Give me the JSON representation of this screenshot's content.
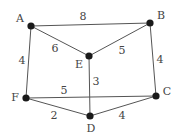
{
  "diagram": {
    "type": "weighted-undirected-graph",
    "nodes": [
      {
        "id": "A",
        "label": "A",
        "x": 31,
        "y": 26,
        "label_x": 20,
        "label_y": 19
      },
      {
        "id": "B",
        "label": "B",
        "x": 150,
        "y": 23,
        "label_x": 161,
        "label_y": 16
      },
      {
        "id": "E",
        "label": "E",
        "x": 89,
        "y": 56,
        "label_x": 79,
        "label_y": 65
      },
      {
        "id": "F",
        "label": "F",
        "x": 26,
        "y": 98,
        "label_x": 15,
        "label_y": 98
      },
      {
        "id": "C",
        "label": "C",
        "x": 156,
        "y": 96,
        "label_x": 167,
        "label_y": 92
      },
      {
        "id": "D",
        "label": "D",
        "x": 90,
        "y": 116,
        "label_x": 91,
        "label_y": 129
      }
    ],
    "edges": [
      {
        "from": "A",
        "to": "B",
        "weight": "8",
        "label_x": 83,
        "label_y": 17
      },
      {
        "from": "A",
        "to": "E",
        "weight": "6",
        "label_x": 55,
        "label_y": 49
      },
      {
        "from": "E",
        "to": "B",
        "weight": "5",
        "label_x": 122,
        "label_y": 51
      },
      {
        "from": "A",
        "to": "F",
        "weight": "4",
        "label_x": 22,
        "label_y": 61
      },
      {
        "from": "B",
        "to": "C",
        "weight": "4",
        "label_x": 160,
        "label_y": 60
      },
      {
        "from": "E",
        "to": "D",
        "weight": "3",
        "label_x": 96,
        "label_y": 82
      },
      {
        "from": "F",
        "to": "C",
        "weight": "5",
        "label_x": 64,
        "label_y": 91
      },
      {
        "from": "F",
        "to": "D",
        "weight": "2",
        "label_x": 54,
        "label_y": 116
      },
      {
        "from": "D",
        "to": "C",
        "weight": "4",
        "label_x": 122,
        "label_y": 116
      }
    ]
  }
}
